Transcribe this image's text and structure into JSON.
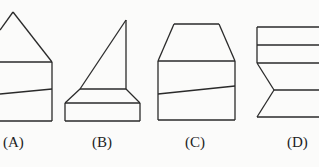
{
  "figures": [
    {
      "id": "A",
      "label": "(A)",
      "label_x": 3,
      "lines": [
        [
          [
            0,
            30
          ],
          [
            13,
            12
          ]
        ],
        [
          [
            13,
            12
          ],
          [
            52,
            62
          ]
        ],
        [
          [
            0,
            62
          ],
          [
            52,
            62
          ]
        ],
        [
          [
            52,
            62
          ],
          [
            52,
            121
          ]
        ],
        [
          [
            0,
            121
          ],
          [
            52,
            121
          ]
        ],
        [
          [
            0,
            94
          ],
          [
            52,
            89
          ]
        ]
      ]
    },
    {
      "id": "B",
      "label": "(B)",
      "label_x": 92,
      "lines": [
        [
          [
            126,
            20
          ],
          [
            126,
            89
          ]
        ],
        [
          [
            126,
            20
          ],
          [
            80,
            89
          ]
        ],
        [
          [
            80,
            89
          ],
          [
            126,
            89
          ]
        ],
        [
          [
            80,
            89
          ],
          [
            65,
            103
          ]
        ],
        [
          [
            126,
            89
          ],
          [
            140,
            103
          ]
        ],
        [
          [
            65,
            103
          ],
          [
            140,
            103
          ]
        ],
        [
          [
            65,
            103
          ],
          [
            65,
            121
          ]
        ],
        [
          [
            140,
            103
          ],
          [
            140,
            121
          ]
        ],
        [
          [
            65,
            121
          ],
          [
            140,
            121
          ]
        ]
      ]
    },
    {
      "id": "C",
      "label": "(C)",
      "label_x": 185,
      "lines": [
        [
          [
            174,
            24
          ],
          [
            219,
            24
          ]
        ],
        [
          [
            174,
            24
          ],
          [
            158,
            61
          ]
        ],
        [
          [
            219,
            24
          ],
          [
            235,
            61
          ]
        ],
        [
          [
            158,
            61
          ],
          [
            235,
            61
          ]
        ],
        [
          [
            158,
            61
          ],
          [
            158,
            120
          ]
        ],
        [
          [
            235,
            61
          ],
          [
            235,
            120
          ]
        ],
        [
          [
            158,
            120
          ],
          [
            235,
            120
          ]
        ],
        [
          [
            158,
            94
          ],
          [
            235,
            86
          ]
        ]
      ]
    },
    {
      "id": "D",
      "label": "(D)",
      "label_x": 287,
      "lines": [
        [
          [
            257,
            27
          ],
          [
            319,
            27
          ]
        ],
        [
          [
            257,
            45
          ],
          [
            319,
            45
          ]
        ],
        [
          [
            257,
            63
          ],
          [
            319,
            63
          ]
        ],
        [
          [
            257,
            27
          ],
          [
            257,
            63
          ]
        ],
        [
          [
            257,
            63
          ],
          [
            274,
            90
          ]
        ],
        [
          [
            274,
            90
          ],
          [
            319,
            90
          ]
        ],
        [
          [
            274,
            90
          ],
          [
            257,
            117
          ]
        ],
        [
          [
            257,
            117
          ],
          [
            319,
            117
          ]
        ]
      ]
    }
  ]
}
